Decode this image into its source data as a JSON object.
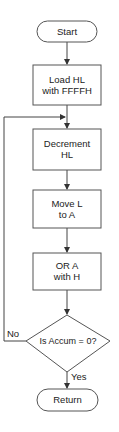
{
  "flowchart": {
    "nodes": [
      {
        "id": "start",
        "type": "terminator",
        "label": "Start"
      },
      {
        "id": "load_hl",
        "type": "process",
        "label_line1": "Load HL",
        "label_line2": "with FFFFH"
      },
      {
        "id": "decrement",
        "type": "process",
        "label_line1": "Decrement",
        "label_line2": "HL"
      },
      {
        "id": "move",
        "type": "process",
        "label_line1": "Move L",
        "label_line2": "to A"
      },
      {
        "id": "or",
        "type": "process",
        "label_line1": "OR A",
        "label_line2": "with H"
      },
      {
        "id": "decision",
        "type": "decision",
        "label": "Is Accum = 0?"
      },
      {
        "id": "return",
        "type": "terminator",
        "label": "Return"
      }
    ],
    "edges": [
      {
        "from": "start",
        "to": "load_hl"
      },
      {
        "from": "load_hl",
        "to": "decrement"
      },
      {
        "from": "decrement",
        "to": "move"
      },
      {
        "from": "move",
        "to": "or"
      },
      {
        "from": "or",
        "to": "decision"
      },
      {
        "from": "decision",
        "to": "decrement",
        "label": "No"
      },
      {
        "from": "decision",
        "to": "return",
        "label": "Yes"
      }
    ],
    "edge_labels": {
      "no": "No",
      "yes": "Yes"
    }
  }
}
